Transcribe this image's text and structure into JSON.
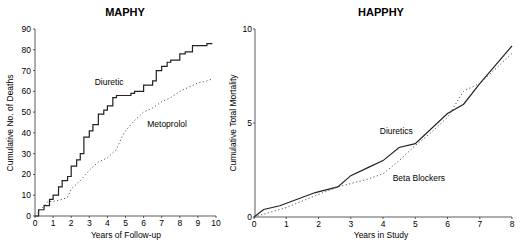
{
  "chart_data": [
    {
      "type": "line",
      "title": "MAPHY",
      "xlabel": "Years of Follow-up",
      "ylabel": "Cumulative No. of Deaths",
      "xlim": [
        0,
        10
      ],
      "ylim": [
        0,
        90
      ],
      "xticks": [
        0,
        1,
        2,
        3,
        4,
        5,
        6,
        7,
        8,
        9,
        10
      ],
      "yticks": [
        0,
        10,
        20,
        30,
        40,
        50,
        60,
        70,
        80,
        90
      ],
      "grid": false,
      "series": [
        {
          "name": "Diuretic",
          "style": "step-solid",
          "x": [
            0,
            0.2,
            0.5,
            0.8,
            1,
            1.3,
            1.5,
            1.8,
            2,
            2.3,
            2.5,
            2.7,
            3,
            3.2,
            3.5,
            3.8,
            4,
            4.3,
            4.5,
            5,
            5.3,
            5.5,
            6,
            6.5,
            6.7,
            7,
            7.3,
            7.5,
            8,
            8.3,
            8.7,
            9,
            9.5,
            9.8
          ],
          "values": [
            0,
            3,
            5,
            8,
            10,
            14,
            17,
            19,
            24,
            27,
            30,
            38,
            41,
            44,
            49,
            51,
            53,
            57,
            58,
            58,
            59,
            60,
            63,
            65,
            70,
            72,
            74,
            75,
            78,
            79,
            82,
            82,
            83,
            83
          ]
        },
        {
          "name": "Metoprolol",
          "style": "dotted",
          "x": [
            0,
            0.4,
            0.7,
            1,
            1.5,
            1.8,
            2,
            2.5,
            3,
            3.5,
            4,
            4.5,
            4.8,
            5,
            5.3,
            5.5,
            6,
            6.5,
            7,
            7.5,
            8,
            8.5,
            9,
            9.5,
            9.8
          ],
          "values": [
            0,
            4,
            7,
            7,
            8,
            9,
            13,
            17,
            22,
            26,
            28,
            32,
            38,
            41,
            44,
            46,
            50,
            52,
            55,
            57,
            60,
            62,
            64,
            65,
            66
          ]
        }
      ],
      "annotations": [
        {
          "text": "Diuretic",
          "x": 3.3,
          "y": 63
        },
        {
          "text": "Metoprolol",
          "x": 6.2,
          "y": 43
        }
      ]
    },
    {
      "type": "line",
      "title": "HAPPHY",
      "xlabel": "Years in Study",
      "ylabel": "Cumulative Total Mortality",
      "xlim": [
        0,
        8
      ],
      "ylim": [
        0,
        10
      ],
      "xticks": [
        0,
        1,
        2,
        3,
        4,
        5,
        6,
        7,
        8
      ],
      "yticks": [
        0,
        5,
        10
      ],
      "grid": false,
      "series": [
        {
          "name": "Diuretics",
          "style": "solid",
          "x": [
            0,
            0.3,
            0.8,
            1.9,
            2.6,
            3,
            3.5,
            4,
            4.5,
            5,
            6,
            6.5,
            7,
            8
          ],
          "values": [
            0,
            0.4,
            0.6,
            1.3,
            1.6,
            2.2,
            2.6,
            3.0,
            3.7,
            3.9,
            5.5,
            6.0,
            7.1,
            9.1
          ]
        },
        {
          "name": "Beta Blockers",
          "style": "dotted",
          "x": [
            0,
            1,
            2,
            2.6,
            3.5,
            4,
            4.5,
            5,
            5.5,
            6,
            6.5,
            7,
            8
          ],
          "values": [
            0,
            0.5,
            1.2,
            1.6,
            2.0,
            2.3,
            3.0,
            3.8,
            4.5,
            5.3,
            6.7,
            7.1,
            8.7
          ]
        }
      ],
      "annotations": [
        {
          "text": "Diuretics",
          "x": 3.9,
          "y": 4.4
        },
        {
          "text": "Beta Blockers",
          "x": 4.3,
          "y": 1.9
        }
      ]
    }
  ]
}
